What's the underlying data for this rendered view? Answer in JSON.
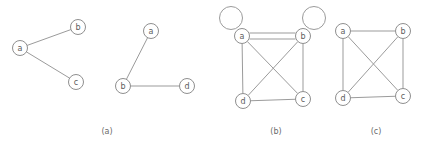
{
  "figure": {
    "background_color": "#ffffff",
    "stroke_color": "#9b9b9b",
    "node_stroke_color": "#8f8f8f",
    "node_fill_color": "#ffffff",
    "label_color": "#5d5d5d",
    "node_radius": 7.5,
    "loop_radius": 11.5
  },
  "panels": [
    {
      "id": "panel-a",
      "caption": "(a)",
      "caption_x": 107,
      "caption_y": 131,
      "nodes": [
        {
          "id": "a1",
          "label": "a",
          "x": 20,
          "y": 48
        },
        {
          "id": "b1",
          "label": "b",
          "x": 78,
          "y": 27
        },
        {
          "id": "c1",
          "label": "c",
          "x": 76,
          "y": 82
        },
        {
          "id": "a2",
          "label": "a",
          "x": 151,
          "y": 31
        },
        {
          "id": "b2",
          "label": "b",
          "x": 123,
          "y": 86
        },
        {
          "id": "d2",
          "label": "d",
          "x": 187,
          "y": 86
        }
      ],
      "edges": [
        {
          "from": "a1",
          "to": "b1"
        },
        {
          "from": "a1",
          "to": "c1"
        },
        {
          "from": "a2",
          "to": "b2"
        },
        {
          "from": "b2",
          "to": "d2"
        }
      ],
      "loops": []
    },
    {
      "id": "panel-b",
      "caption": "(b)",
      "caption_x": 276,
      "caption_y": 131,
      "nodes": [
        {
          "id": "a",
          "label": "a",
          "x": 242,
          "y": 36
        },
        {
          "id": "b",
          "label": "b",
          "x": 303,
          "y": 36
        },
        {
          "id": "c",
          "label": "c",
          "x": 303,
          "y": 99
        },
        {
          "id": "d",
          "label": "d",
          "x": 243,
          "y": 101
        }
      ],
      "edges": [
        {
          "from": "a",
          "to": "b",
          "offset": -3
        },
        {
          "from": "a",
          "to": "b",
          "offset": 3
        },
        {
          "from": "a",
          "to": "c"
        },
        {
          "from": "a",
          "to": "d"
        },
        {
          "from": "b",
          "to": "c"
        },
        {
          "from": "b",
          "to": "d"
        },
        {
          "from": "d",
          "to": "c"
        }
      ],
      "loops": [
        {
          "node": "a",
          "cx": 231,
          "cy": 18,
          "r": 11.5
        },
        {
          "node": "b",
          "cx": 314,
          "cy": 18,
          "r": 11.5
        }
      ]
    },
    {
      "id": "panel-c",
      "caption": "(c)",
      "caption_x": 376,
      "caption_y": 131,
      "nodes": [
        {
          "id": "a",
          "label": "a",
          "x": 343,
          "y": 31
        },
        {
          "id": "b",
          "label": "b",
          "x": 403,
          "y": 31
        },
        {
          "id": "c",
          "label": "c",
          "x": 403,
          "y": 96
        },
        {
          "id": "d",
          "label": "d",
          "x": 343,
          "y": 98
        }
      ],
      "edges": [
        {
          "from": "a",
          "to": "b"
        },
        {
          "from": "a",
          "to": "c"
        },
        {
          "from": "a",
          "to": "d"
        },
        {
          "from": "b",
          "to": "c"
        },
        {
          "from": "b",
          "to": "d"
        },
        {
          "from": "d",
          "to": "c"
        }
      ],
      "loops": []
    }
  ]
}
